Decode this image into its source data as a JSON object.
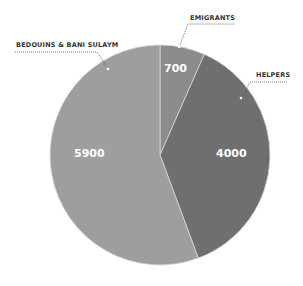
{
  "chart_data": {
    "type": "pie",
    "title": "",
    "total": 10600,
    "slices": [
      {
        "label": "EMIGRANTS",
        "value": 700,
        "color": "#8b8b8b"
      },
      {
        "label": "HELPERS",
        "value": 4000,
        "color": "#6f6f6f"
      },
      {
        "label": "BEDOUINS & BANI SULAYM",
        "value": 5900,
        "color": "#9e9e9e"
      }
    ],
    "value_labels": [
      "700",
      "4000",
      "5900"
    ],
    "legend": "callout labels with dotted leader lines"
  }
}
